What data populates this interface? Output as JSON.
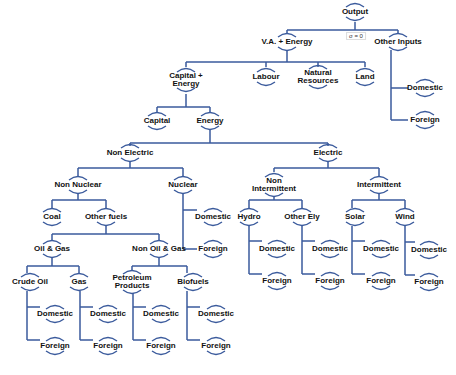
{
  "diagram": {
    "type": "nested CES production tree",
    "line_color": "#3a5a9c",
    "elasticity_label": "σ = 0",
    "nodes": [
      {
        "id": "output",
        "label": "Output",
        "x": 355,
        "y": 12
      },
      {
        "id": "va_energy",
        "label": "V.A. + Energy",
        "x": 287,
        "y": 42
      },
      {
        "id": "other_inputs",
        "label": "Other Inputs",
        "x": 398,
        "y": 42
      },
      {
        "id": "oi_domestic",
        "label": "Domestic",
        "x": 425,
        "y": 88
      },
      {
        "id": "oi_foreign",
        "label": "Foreign",
        "x": 425,
        "y": 120
      },
      {
        "id": "capital_energy",
        "label": "Capital +\nEnergy",
        "x": 186,
        "y": 80
      },
      {
        "id": "labour",
        "label": "Labour",
        "x": 266,
        "y": 77
      },
      {
        "id": "natural_resources",
        "label": "Natural\nResources",
        "x": 318,
        "y": 77
      },
      {
        "id": "land",
        "label": "Land",
        "x": 365,
        "y": 77
      },
      {
        "id": "capital",
        "label": "Capital",
        "x": 157,
        "y": 121
      },
      {
        "id": "energy",
        "label": "Energy",
        "x": 210,
        "y": 121
      },
      {
        "id": "non_electric",
        "label": "Non Electric",
        "x": 130,
        "y": 153
      },
      {
        "id": "electric",
        "label": "Electric",
        "x": 328,
        "y": 153
      },
      {
        "id": "non_nuclear",
        "label": "Non Nuclear",
        "x": 78,
        "y": 185
      },
      {
        "id": "nuclear",
        "label": "Nuclear",
        "x": 183,
        "y": 185
      },
      {
        "id": "nuc_domestic",
        "label": "Domestic",
        "x": 213,
        "y": 217
      },
      {
        "id": "nuc_foreign",
        "label": "Foreign",
        "x": 213,
        "y": 249
      },
      {
        "id": "coal",
        "label": "Coal",
        "x": 52,
        "y": 217
      },
      {
        "id": "other_fuels",
        "label": "Other fuels",
        "x": 106,
        "y": 217
      },
      {
        "id": "oil_gas",
        "label": "Oil & Gas",
        "x": 52,
        "y": 249
      },
      {
        "id": "non_oil_gas",
        "label": "Non Oil & Gas",
        "x": 159,
        "y": 249
      },
      {
        "id": "crude_oil",
        "label": "Crude Oil",
        "x": 30,
        "y": 282
      },
      {
        "id": "gas",
        "label": "Gas",
        "x": 79,
        "y": 282
      },
      {
        "id": "petroleum",
        "label": "Petroleum\nProducts",
        "x": 132,
        "y": 282
      },
      {
        "id": "biofuels",
        "label": "Biofuels",
        "x": 193,
        "y": 282
      },
      {
        "id": "co_domestic",
        "label": "Domestic",
        "x": 55,
        "y": 314
      },
      {
        "id": "co_foreign",
        "label": "Foreign",
        "x": 55,
        "y": 346
      },
      {
        "id": "gas_domestic",
        "label": "Domestic",
        "x": 108,
        "y": 314
      },
      {
        "id": "gas_foreign",
        "label": "Foreign",
        "x": 108,
        "y": 346
      },
      {
        "id": "pp_domestic",
        "label": "Domestic",
        "x": 161,
        "y": 314
      },
      {
        "id": "pp_foreign",
        "label": "Foreign",
        "x": 161,
        "y": 346
      },
      {
        "id": "bf_domestic",
        "label": "Domestic",
        "x": 216,
        "y": 314
      },
      {
        "id": "bf_foreign",
        "label": "Foreign",
        "x": 216,
        "y": 346
      },
      {
        "id": "non_intermittent",
        "label": "Non\nIntermittent",
        "x": 274,
        "y": 185
      },
      {
        "id": "intermittent",
        "label": "Intermittent",
        "x": 379,
        "y": 185
      },
      {
        "id": "hydro",
        "label": "Hydro",
        "x": 249,
        "y": 217
      },
      {
        "id": "other_ely",
        "label": "Other Ely",
        "x": 302,
        "y": 217
      },
      {
        "id": "solar",
        "label": "Solar",
        "x": 355,
        "y": 217
      },
      {
        "id": "wind",
        "label": "Wind",
        "x": 405,
        "y": 217
      },
      {
        "id": "hy_domestic",
        "label": "Domestic",
        "x": 277,
        "y": 249
      },
      {
        "id": "hy_foreign",
        "label": "Foreign",
        "x": 277,
        "y": 281
      },
      {
        "id": "oe_domestic",
        "label": "Domestic",
        "x": 330,
        "y": 249
      },
      {
        "id": "oe_foreign",
        "label": "Foreign",
        "x": 330,
        "y": 281
      },
      {
        "id": "so_domestic",
        "label": "Domestic",
        "x": 381,
        "y": 249
      },
      {
        "id": "so_foreign",
        "label": "Foreign",
        "x": 381,
        "y": 281
      },
      {
        "id": "wi_domestic",
        "label": "Domestic",
        "x": 429,
        "y": 250
      },
      {
        "id": "wi_foreign",
        "label": "Foreign",
        "x": 429,
        "y": 282
      }
    ]
  }
}
